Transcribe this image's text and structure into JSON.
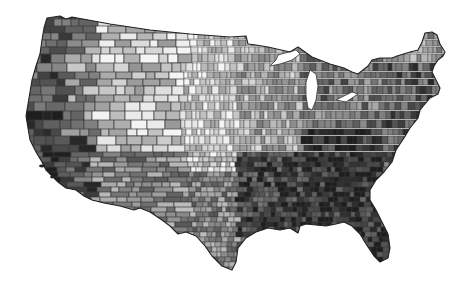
{
  "map": {
    "type": "choropleth",
    "region": "Contiguous United States",
    "unit": "county",
    "color_scheme": "grayscale",
    "colors": {
      "background": "#ffffff",
      "border": "#2a2a2a",
      "lightest": "#f4f4f4",
      "light": "#c8c8c8",
      "medium": "#8c8c8c",
      "dark": "#555555",
      "darkest": "#222222"
    },
    "legend": null,
    "title": null,
    "regional_shading": [
      {
        "region": "pacific-northwest-coast",
        "level": "dark"
      },
      {
        "region": "california",
        "level": "darkest"
      },
      {
        "region": "mountain-west",
        "level": "light-mixed"
      },
      {
        "region": "great-plains",
        "level": "lightest"
      },
      {
        "region": "midwest",
        "level": "light-medium"
      },
      {
        "region": "texas",
        "level": "medium"
      },
      {
        "region": "southeast",
        "level": "darkest"
      },
      {
        "region": "florida",
        "level": "darkest"
      },
      {
        "region": "mid-atlantic",
        "level": "dark"
      },
      {
        "region": "new-england",
        "level": "medium"
      },
      {
        "region": "maine",
        "level": "medium-light"
      }
    ]
  }
}
